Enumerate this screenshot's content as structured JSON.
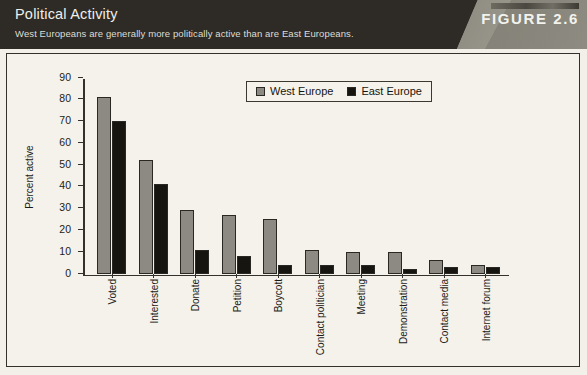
{
  "header": {
    "title": "Political Activity",
    "subtitle": "West Europeans are generally more politically active than are East Europeans.",
    "figure_label": "FIGURE 2.6"
  },
  "legend": {
    "west_label": "West Europe",
    "east_label": "East Europe",
    "west_color": "#8c8a83",
    "east_color": "#17150f",
    "position": "top-center"
  },
  "chart_data": {
    "type": "bar",
    "title": "Political Activity",
    "subtitle": "West Europeans are generally more politically active than are East Europeans.",
    "xlabel": "",
    "ylabel": "Percent active",
    "ylim": [
      0,
      90
    ],
    "yticks": [
      0,
      10,
      20,
      30,
      40,
      50,
      60,
      70,
      80,
      90
    ],
    "grid": false,
    "categories": [
      "Voted",
      "Interested",
      "Donate",
      "Petition",
      "Boycott",
      "Contact politician",
      "Meeting",
      "Demonstration",
      "Contact media",
      "Internet forum"
    ],
    "series": [
      {
        "name": "West Europe",
        "color": "#8c8a83",
        "values": [
          81,
          52,
          29,
          27,
          25,
          11,
          10,
          10,
          6,
          4
        ]
      },
      {
        "name": "East Europe",
        "color": "#17150f",
        "values": [
          70,
          41,
          11,
          8,
          4,
          4,
          4,
          2,
          3,
          3
        ]
      }
    ]
  }
}
